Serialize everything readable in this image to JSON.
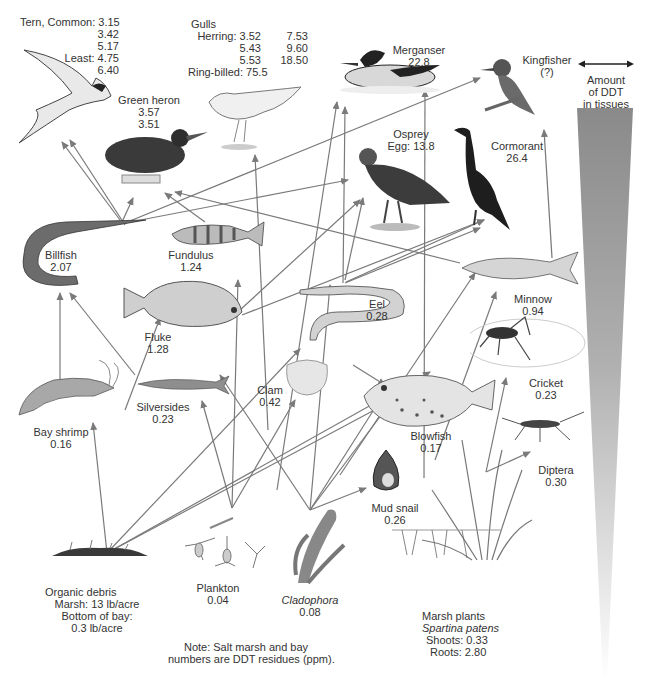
{
  "diagram": {
    "type": "food-web",
    "legend": {
      "arrow_meaning": "Amount of DDT in tissues",
      "line1": "Amount",
      "line2": "of DDT",
      "line3": "in tissues",
      "gradient_top_color": "#8a8a8a",
      "gradient_bottom_color": "#ffffff"
    },
    "note": {
      "line1": "Note: Salt marsh and bay",
      "line2": "numbers are DDT residues (ppm)."
    },
    "organisms": {
      "tern": {
        "name": "Tern, Common:",
        "values": [
          "3.15",
          "3.42",
          "5.17"
        ],
        "least_label": "Least:",
        "least_values": [
          "4.75",
          "6.40"
        ]
      },
      "gulls": {
        "name": "Gulls",
        "herring_label": "Herring:",
        "herring_col1": [
          "3.52",
          "5.43",
          "5.53"
        ],
        "herring_col2": [
          "7.53",
          "9.60",
          "18.50"
        ],
        "ringbilled_label": "Ring-billed:",
        "ringbilled_value": "75.5"
      },
      "merganser": {
        "name": "Merganser",
        "value": "22.8"
      },
      "kingfisher": {
        "name": "Kingfisher",
        "value": "(?)"
      },
      "green_heron": {
        "name": "Green heron",
        "values": [
          "3.57",
          "3.51"
        ]
      },
      "osprey": {
        "name": "Osprey",
        "value": "Egg: 13.8"
      },
      "cormorant": {
        "name": "Cormorant",
        "value": "26.4"
      },
      "billfish": {
        "name": "Billfish",
        "value": "2.07"
      },
      "fundulus": {
        "name": "Fundulus",
        "value": "1.24"
      },
      "fluke": {
        "name": "Fluke",
        "value": "1.28"
      },
      "eel": {
        "name": "Eel",
        "value": "0.28"
      },
      "minnow": {
        "name": "Minnow",
        "value": "0.94"
      },
      "clam": {
        "name": "Clam",
        "value": "0.42"
      },
      "silversides": {
        "name": "Silversides",
        "value": "0.23"
      },
      "bay_shrimp": {
        "name": "Bay shrimp",
        "value": "0.16"
      },
      "blowfish": {
        "name": "Blowfish",
        "value": "0.17"
      },
      "cricket": {
        "name": "Cricket",
        "value": "0.23"
      },
      "diptera": {
        "name": "Diptera",
        "value": "0.30"
      },
      "mud_snail": {
        "name": "Mud snail",
        "value": "0.26"
      },
      "organic_debris": {
        "name": "Organic debris",
        "line1": "Marsh: 13 lb/acre",
        "line2": "Bottom of bay:",
        "line3": "0.3 lb/acre"
      },
      "plankton": {
        "name": "Plankton",
        "value": "0.04"
      },
      "cladophora": {
        "name": "Cladophora",
        "value": "0.08"
      },
      "marsh_plants": {
        "name": "Marsh plants",
        "species": "Spartina patens",
        "shoots": "Shoots: 0.33",
        "roots": "Roots: 2.80"
      }
    },
    "colors": {
      "arrow": "#7a7a7a",
      "text": "#333333"
    }
  }
}
